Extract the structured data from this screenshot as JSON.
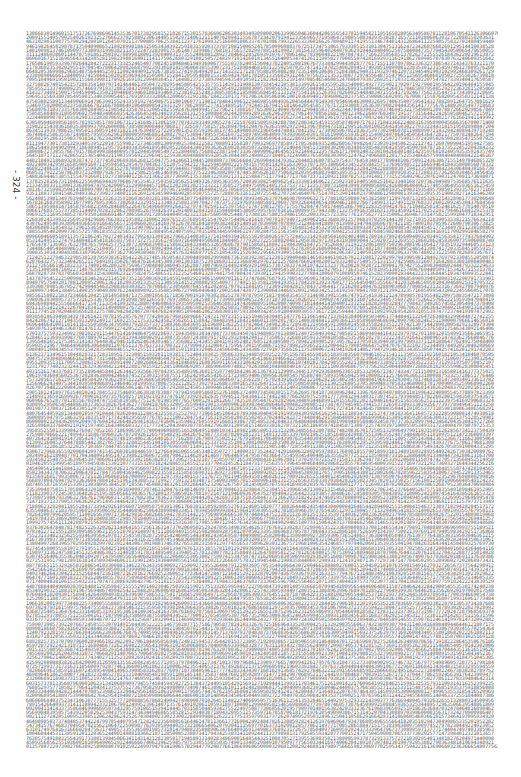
{
  "page": {
    "page_number": "- 324 -",
    "content_type": "digit listing",
    "first_line": "1306683014960151751736769869614535367017382958152182671530157836696206303493493098002063399650463604420655654370159458211951650280563495867811281067054112630660706653786147465961101145419866780819350",
    "last_line": "0135780722973982706389258908807910250224997947934190657029447792087766186699606500903206812082924688147989756665982306977025953437594221613690660323636665480775631393666674806665362829665420",
    "line_count": 170,
    "chars_per_line": 160,
    "seed": 324
  }
}
